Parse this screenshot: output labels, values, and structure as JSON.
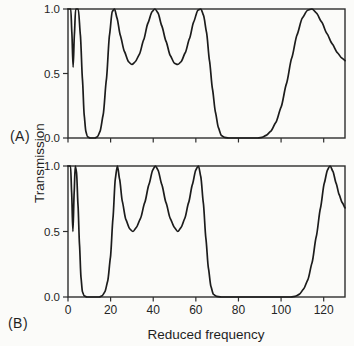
{
  "figure": {
    "ylabel": "Transmission",
    "xlabel": "Reduced frequency",
    "panel_a_label": "(A)",
    "panel_b_label": "(B)"
  },
  "colors": {
    "curve": "#1c1c1c",
    "axis": "#2e2e2e",
    "tick_text": "#252525",
    "background": "#fbfbf9"
  },
  "chart_data": [
    {
      "type": "line",
      "panel": "A",
      "title": "(A)",
      "xlabel": "",
      "ylabel": "Transmission",
      "xlim": [
        0,
        130
      ],
      "ylim": [
        0.0,
        1.0
      ],
      "grid": false,
      "legend": "none",
      "x_ticks": [
        0,
        20,
        40,
        60,
        80,
        100,
        120
      ],
      "x_tick_labels": [
        "",
        "",
        "",
        "",
        "",
        "",
        ""
      ],
      "show_x_tick_labels": false,
      "y_ticks": [
        0.0,
        0.5,
        1.0
      ],
      "y_tick_labels": [
        "0.0",
        "0.5",
        "1.0"
      ],
      "series": [
        {
          "name": "transmission",
          "points": [
            [
              0,
              1.0
            ],
            [
              1.3,
              1.0
            ],
            [
              1.8,
              0.82
            ],
            [
              2.4,
              0.55
            ],
            [
              3.0,
              0.8
            ],
            [
              3.6,
              1.0
            ],
            [
              4.8,
              1.0
            ],
            [
              5.8,
              0.8
            ],
            [
              6.8,
              0.45
            ],
            [
              7.6,
              0.18
            ],
            [
              8.4,
              0.05
            ],
            [
              9.2,
              0.01
            ],
            [
              10.5,
              0.0
            ],
            [
              12.5,
              0.0
            ],
            [
              13.8,
              0.01
            ],
            [
              15.0,
              0.05
            ],
            [
              16.5,
              0.18
            ],
            [
              18.0,
              0.45
            ],
            [
              19.5,
              0.8
            ],
            [
              20.8,
              0.98
            ],
            [
              21.8,
              1.0
            ],
            [
              23.0,
              0.93
            ],
            [
              24.5,
              0.8
            ],
            [
              26.5,
              0.67
            ],
            [
              28.5,
              0.59
            ],
            [
              30.0,
              0.57
            ],
            [
              31.5,
              0.59
            ],
            [
              33.5,
              0.65
            ],
            [
              35.5,
              0.76
            ],
            [
              37.5,
              0.89
            ],
            [
              39.5,
              0.98
            ],
            [
              40.8,
              1.0
            ],
            [
              42.2,
              0.97
            ],
            [
              44.0,
              0.87
            ],
            [
              46.0,
              0.75
            ],
            [
              48.0,
              0.64
            ],
            [
              50.0,
              0.58
            ],
            [
              51.5,
              0.57
            ],
            [
              53.0,
              0.59
            ],
            [
              55.0,
              0.66
            ],
            [
              57.0,
              0.77
            ],
            [
              59.0,
              0.9
            ],
            [
              61.0,
              0.99
            ],
            [
              62.3,
              1.0
            ],
            [
              63.6,
              0.95
            ],
            [
              65.0,
              0.82
            ],
            [
              66.4,
              0.6
            ],
            [
              67.8,
              0.38
            ],
            [
              69.2,
              0.2
            ],
            [
              70.6,
              0.08
            ],
            [
              72.0,
              0.02
            ],
            [
              73.5,
              0.005
            ],
            [
              75.5,
              0.0
            ],
            [
              89.0,
              0.0
            ],
            [
              91.0,
              0.005
            ],
            [
              93.0,
              0.02
            ],
            [
              95.0,
              0.05
            ],
            [
              97.5,
              0.12
            ],
            [
              100.0,
              0.24
            ],
            [
              102.5,
              0.42
            ],
            [
              105.0,
              0.62
            ],
            [
              107.5,
              0.8
            ],
            [
              110.0,
              0.93
            ],
            [
              112.5,
              0.99
            ],
            [
              114.5,
              1.0
            ],
            [
              116.5,
              0.97
            ],
            [
              119.0,
              0.9
            ],
            [
              121.5,
              0.81
            ],
            [
              124.0,
              0.73
            ],
            [
              126.5,
              0.66
            ],
            [
              128.5,
              0.62
            ],
            [
              130.0,
              0.6
            ]
          ]
        }
      ]
    },
    {
      "type": "line",
      "panel": "B",
      "title": "(B)",
      "xlabel": "Reduced frequency",
      "ylabel": "Transmission",
      "xlim": [
        0,
        130
      ],
      "ylim": [
        0.0,
        1.0
      ],
      "grid": false,
      "legend": "none",
      "x_ticks": [
        0,
        20,
        40,
        60,
        80,
        100,
        120
      ],
      "x_tick_labels": [
        "0",
        "20",
        "40",
        "60",
        "80",
        "100",
        "120"
      ],
      "show_x_tick_labels": true,
      "y_ticks": [
        0.0,
        0.5,
        1.0
      ],
      "y_tick_labels": [
        "0.0",
        "0.5",
        "1.0"
      ],
      "series": [
        {
          "name": "transmission",
          "points": [
            [
              0,
              1.0
            ],
            [
              1.2,
              1.0
            ],
            [
              1.7,
              0.8
            ],
            [
              2.3,
              0.5
            ],
            [
              2.9,
              0.8
            ],
            [
              3.4,
              1.0
            ],
            [
              4.0,
              0.95
            ],
            [
              4.7,
              0.7
            ],
            [
              5.4,
              0.4
            ],
            [
              6.1,
              0.15
            ],
            [
              6.8,
              0.04
            ],
            [
              7.6,
              0.01
            ],
            [
              9.0,
              0.0
            ],
            [
              14.5,
              0.0
            ],
            [
              16.0,
              0.01
            ],
            [
              17.3,
              0.04
            ],
            [
              18.6,
              0.12
            ],
            [
              19.9,
              0.3
            ],
            [
              21.1,
              0.6
            ],
            [
              22.2,
              0.9
            ],
            [
              23.2,
              1.0
            ],
            [
              24.2,
              0.9
            ],
            [
              25.5,
              0.73
            ],
            [
              27.2,
              0.59
            ],
            [
              29.0,
              0.52
            ],
            [
              30.5,
              0.5
            ],
            [
              32.0,
              0.53
            ],
            [
              34.0,
              0.6
            ],
            [
              36.0,
              0.72
            ],
            [
              38.0,
              0.86
            ],
            [
              39.8,
              0.97
            ],
            [
              41.0,
              1.0
            ],
            [
              42.2,
              0.97
            ],
            [
              44.0,
              0.86
            ],
            [
              46.0,
              0.72
            ],
            [
              48.0,
              0.6
            ],
            [
              50.0,
              0.53
            ],
            [
              51.5,
              0.5
            ],
            [
              53.0,
              0.53
            ],
            [
              54.8,
              0.6
            ],
            [
              56.6,
              0.72
            ],
            [
              58.4,
              0.86
            ],
            [
              60.0,
              0.97
            ],
            [
              61.2,
              1.0
            ],
            [
              62.3,
              0.92
            ],
            [
              63.5,
              0.72
            ],
            [
              64.7,
              0.45
            ],
            [
              65.9,
              0.22
            ],
            [
              67.1,
              0.08
            ],
            [
              68.3,
              0.02
            ],
            [
              69.8,
              0.005
            ],
            [
              72.0,
              0.0
            ],
            [
              104.5,
              0.0
            ],
            [
              106.5,
              0.005
            ],
            [
              108.5,
              0.02
            ],
            [
              110.5,
              0.06
            ],
            [
              112.5,
              0.13
            ],
            [
              114.5,
              0.26
            ],
            [
              116.5,
              0.46
            ],
            [
              118.5,
              0.68
            ],
            [
              120.3,
              0.87
            ],
            [
              121.8,
              0.97
            ],
            [
              123.0,
              1.0
            ],
            [
              124.3,
              0.96
            ],
            [
              125.8,
              0.87
            ],
            [
              127.3,
              0.78
            ],
            [
              128.7,
              0.72
            ],
            [
              130.0,
              0.68
            ]
          ]
        }
      ]
    }
  ]
}
